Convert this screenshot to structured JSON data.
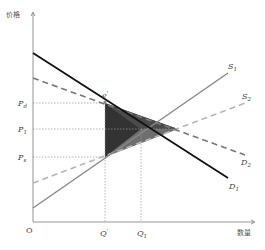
{
  "diagram": {
    "type": "economics-supply-demand",
    "y_axis_label": "价格",
    "x_axis_label": "数量",
    "origin_label": "O",
    "price_labels": [
      {
        "main": "P",
        "sub": "d",
        "y": 103
      },
      {
        "main": "P",
        "sub": "1",
        "y": 129
      },
      {
        "main": "P",
        "sub": "s",
        "y": 157
      }
    ],
    "quantity_labels": [
      {
        "main": "Q",
        "sub": "'",
        "x": 105
      },
      {
        "main": "Q",
        "sub": "1",
        "x": 141
      }
    ],
    "point_label": {
      "main": "e",
      "sub": "'"
    },
    "curves": [
      {
        "name": "D1",
        "main": "D",
        "sub": "1",
        "style": "solid",
        "color": "#111111",
        "from": [
          33,
          53
        ],
        "to": [
          228,
          178
        ]
      },
      {
        "name": "D2",
        "main": "D",
        "sub": "2",
        "style": "dashed",
        "color": "#777777",
        "from": [
          33,
          78
        ],
        "to": [
          245,
          155
        ]
      },
      {
        "name": "S1",
        "main": "S",
        "sub": "1",
        "style": "solid",
        "color": "#8a8a8a",
        "from": [
          33,
          208
        ],
        "to": [
          228,
          73
        ]
      },
      {
        "name": "S2",
        "main": "S",
        "sub": "2",
        "style": "dashed",
        "color": "#b5b5b5",
        "from": [
          33,
          183
        ],
        "to": [
          248,
          102
        ]
      }
    ],
    "shaded_region": {
      "color_dark": "#333333",
      "color_mid": "#6a6a6a",
      "points": [
        [
          105,
          103
        ],
        [
          105,
          157
        ],
        [
          178,
          129
        ]
      ]
    }
  }
}
